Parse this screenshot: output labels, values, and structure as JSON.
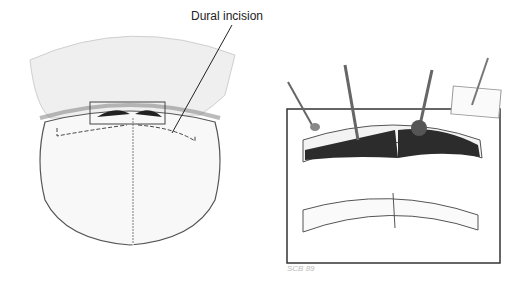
{
  "figure": {
    "left_panel": {
      "description": "Top view of skull with reflected scalp flap, boxed region showing frontal sinus and dashed dural incision line",
      "callout_label": "Dural incision"
    },
    "right_panel": {
      "description": "Magnified cross-section of frontal sinus: top shows instruments removing mucosa; bottom shows cleaned sinus",
      "signature": "SCB 89"
    },
    "colors": {
      "line": "#222222",
      "fill_dark": "#2a2a2a",
      "paper": "#ffffff",
      "shade": "#e6e6e6"
    }
  }
}
